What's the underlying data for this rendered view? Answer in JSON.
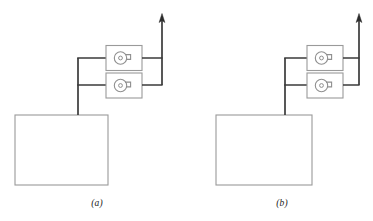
{
  "figure": {
    "type": "process-flow-diagram",
    "panel_count": 2,
    "background_color": "#ffffff"
  },
  "colors": {
    "pipe_line": "#3a3a3a",
    "equipment_outline": "#9a9a9a",
    "tank_outline": "#9a9a9a",
    "pump_symbol": "#8f8f8f",
    "caption_text": "#1a1a1a",
    "background": "#ffffff"
  },
  "panels": [
    {
      "id": "panel-a",
      "caption": "(a)",
      "tank": {
        "name": "storage-tank",
        "x": 15,
        "y": 115,
        "width": 93,
        "height": 70
      },
      "riser": {
        "name": "suction-riser",
        "x": 78,
        "top_y": 58,
        "bottom_y": 115
      },
      "branches": [
        {
          "name": "suction-branch-upper",
          "y": 58,
          "x1": 78,
          "x2": 106
        },
        {
          "name": "suction-branch-lower",
          "y": 85,
          "x1": 78,
          "x2": 106
        }
      ],
      "pumps": [
        {
          "name": "pump-upper",
          "label": "centrifugal-pump",
          "x": 106,
          "y": 45,
          "width": 36,
          "height": 25
        },
        {
          "name": "pump-lower",
          "label": "centrifugal-pump",
          "x": 106,
          "y": 73,
          "width": 36,
          "height": 25
        }
      ],
      "outlets": [
        {
          "name": "discharge-branch-upper",
          "y": 58,
          "x1": 142,
          "x2": 162
        },
        {
          "name": "discharge-branch-lower",
          "y": 85,
          "x1": 142,
          "x2": 162
        }
      ],
      "discharge": {
        "name": "discharge-header",
        "x": 162,
        "top_y": 16,
        "bottom_y": 85,
        "arrow": "up-arrow"
      }
    },
    {
      "id": "panel-b",
      "caption": "(b)",
      "tank": {
        "name": "storage-tank",
        "x": 29,
        "y": 115,
        "width": 96,
        "height": 70
      },
      "riser": {
        "name": "suction-riser",
        "x": 98,
        "top_y": 58,
        "bottom_y": 115
      },
      "branches": [
        {
          "name": "suction-branch-upper",
          "y": 58,
          "x1": 98,
          "x2": 120
        },
        {
          "name": "suction-branch-lower",
          "y": 85,
          "x1": 98,
          "x2": 120
        }
      ],
      "pumps": [
        {
          "name": "pump-upper",
          "label": "centrifugal-pump",
          "x": 120,
          "y": 45,
          "width": 36,
          "height": 25
        },
        {
          "name": "pump-lower",
          "label": "centrifugal-pump",
          "x": 120,
          "y": 73,
          "width": 36,
          "height": 25
        }
      ],
      "outlets": [
        {
          "name": "discharge-branch-upper",
          "y": 58,
          "x1": 156,
          "x2": 172
        },
        {
          "name": "discharge-branch-lower",
          "y": 85,
          "x1": 156,
          "x2": 172
        }
      ],
      "discharge": {
        "name": "discharge-header",
        "x": 172,
        "top_y": 16,
        "bottom_y": 85,
        "arrow": "up-arrow"
      }
    }
  ]
}
